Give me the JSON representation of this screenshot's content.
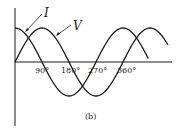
{
  "figure": {
    "caption": "(b)",
    "curves": [
      {
        "name": "current",
        "label": "I",
        "function": "cos",
        "phase_lead_deg": 90
      },
      {
        "name": "voltage",
        "label": "V",
        "function": "sin",
        "phase_lead_deg": 0
      }
    ],
    "x_ticks": [
      "90°",
      "180°",
      "270°",
      "360°"
    ],
    "stroke_color": "#1a1a1a"
  },
  "chart_data": {
    "type": "line",
    "title": "",
    "xlabel": "",
    "ylabel": "",
    "x_tick_labels": [
      "90°",
      "180°",
      "270°",
      "360°"
    ],
    "series": [
      {
        "name": "I",
        "description": "cosine, leads V by 90°",
        "x_deg": [
          0,
          90,
          180,
          270,
          360,
          450
        ],
        "values": [
          1,
          0,
          -1,
          0,
          1,
          0
        ]
      },
      {
        "name": "V",
        "description": "sine",
        "x_deg": [
          0,
          90,
          180,
          270,
          360,
          450,
          510
        ],
        "values": [
          0,
          1,
          0,
          -1,
          0,
          1,
          0.5
        ]
      }
    ],
    "caption": "(b)"
  }
}
